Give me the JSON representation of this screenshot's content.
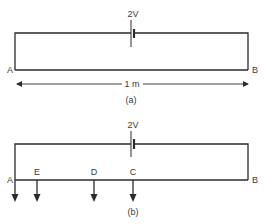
{
  "diagram_a": {
    "battery_label": "2V",
    "left_terminal": "A",
    "right_terminal": "B",
    "length_label": "1 m",
    "caption": "(a)"
  },
  "diagram_b": {
    "battery_label": "2V",
    "left_terminal": "A",
    "right_terminal": "B",
    "points": [
      {
        "label": "E"
      },
      {
        "label": "D"
      },
      {
        "label": "C"
      }
    ],
    "caption": "(b)"
  },
  "colors": {
    "line": "#2b2b2b",
    "text": "#3a3a3a",
    "background": "#ffffff"
  }
}
